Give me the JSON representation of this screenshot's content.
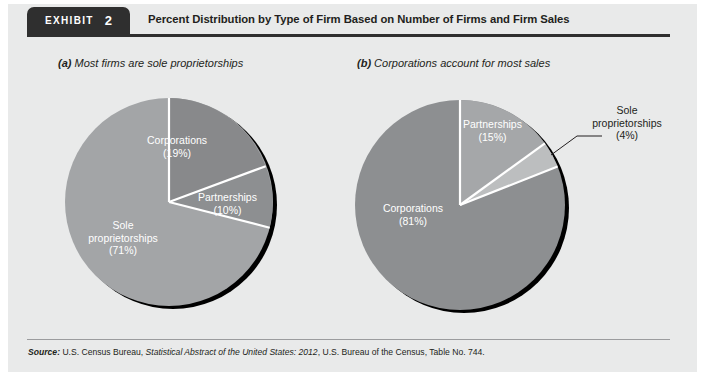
{
  "exhibit": {
    "badge_word": "EXHIBIT",
    "badge_number": "2",
    "title": "Percent Distribution by Type of Firm Based on Number of Firms and Firm Sales"
  },
  "panels": {
    "a": {
      "marker": "(a)",
      "caption": " Most firms are sole proprietorships",
      "labels": {
        "corporations": "Corporations\n(19%)",
        "partnerships": "Partnerships\n(10%)",
        "sole": "Sole\nproprietorships\n(71%)"
      }
    },
    "b": {
      "marker": "(b)",
      "caption": " Corporations account for most sales",
      "labels": {
        "partnerships": "Partnerships\n(15%)",
        "sole": "Sole\nproprietorships\n(4%)",
        "corporations": "Corporations\n(81%)"
      }
    }
  },
  "source": {
    "label": "Source:",
    "text_1": " U.S. Census Bureau, ",
    "italic_1": "Statistical Abstract of the United States: 2012",
    "text_2": ", U.S. Bureau of the Census, Table No. 744."
  },
  "colors": {
    "panel_background": "#e9eaea",
    "badge_dark": "#2f2f2f",
    "slice_light": "#a3a5a7",
    "slice_medium": "#8d8f91",
    "slice_dark": "#7f8183",
    "slice_pale": "#b9bbbd",
    "divider_white": "#ffffff",
    "shadow_black": "#000000",
    "text_dark": "#231f20",
    "text_light": "#ffffff",
    "footer_rule": "#9b9c9e"
  },
  "chart_data": [
    {
      "type": "pie",
      "id": "chart-a",
      "title": "(a) Most firms are sole proprietorships",
      "categories": [
        "Sole proprietorships",
        "Corporations",
        "Partnerships"
      ],
      "values": [
        71,
        19,
        10
      ],
      "unit": "%",
      "legend": "inside-slices",
      "labels": [
        "Sole proprietorships (71%)",
        "Corporations (19%)",
        "Partnerships (10%)"
      ],
      "center": [
        165,
        200
      ],
      "radius": 104,
      "start_angle_deg": 0,
      "direction": "clockwise"
    },
    {
      "type": "pie",
      "id": "chart-b",
      "title": "(b) Corporations account for most sales",
      "categories": [
        "Corporations",
        "Partnerships",
        "Sole proprietorships"
      ],
      "values": [
        81,
        15,
        4
      ],
      "unit": "%",
      "legend": "inside-slices-plus-callout",
      "labels": [
        "Corporations (81%)",
        "Partnerships (15%)",
        "Sole proprietorships (4%)"
      ],
      "center": [
        460,
        205
      ],
      "radius": 105,
      "start_angle_deg": 0,
      "direction": "clockwise"
    }
  ]
}
